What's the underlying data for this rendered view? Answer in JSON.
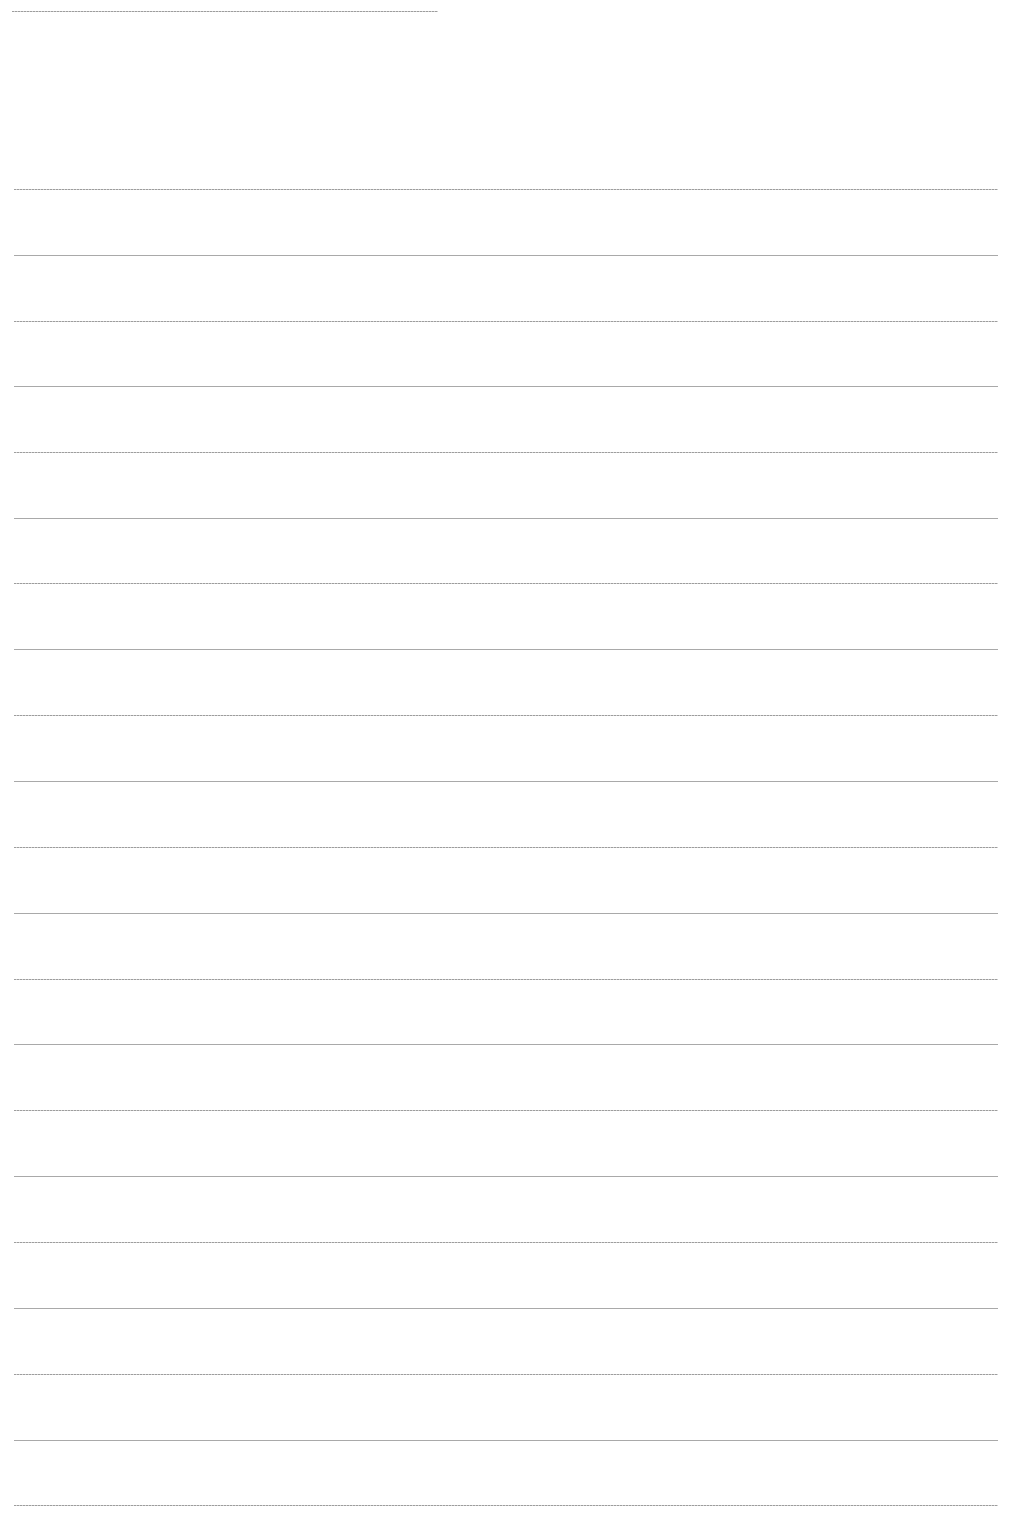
{
  "page": {
    "type": "ruled-notebook-page",
    "background_color": "#ffffff",
    "line_color": "#9a9a9a",
    "header_line": {
      "y": 11,
      "x_start": 12,
      "x_end": 438
    },
    "body_lines": {
      "x_start": 14,
      "x_end": 998,
      "y_positions": [
        189,
        255,
        321,
        386,
        452,
        518,
        583,
        649,
        715,
        781,
        847,
        913,
        979,
        1044,
        1110,
        1176,
        1242,
        1308,
        1374,
        1440,
        1505
      ]
    },
    "text_content": []
  }
}
